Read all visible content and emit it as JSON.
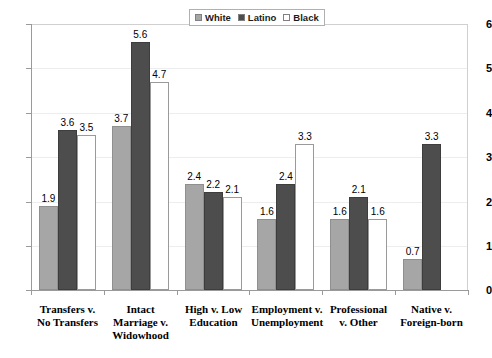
{
  "chart_data": {
    "type": "bar",
    "title": "",
    "subtitle": "",
    "xlabel": "",
    "ylabel": "",
    "ylim": [
      0,
      6
    ],
    "yticks": [
      "0",
      "1",
      "2",
      "3",
      "4",
      "5",
      "6"
    ],
    "grid": true,
    "legend_position": "top-center",
    "categories": [
      "Transfers v.\nNo Transfers",
      "Intact\nMarriage v.\nWidowhood",
      "High v. Low\nEducation",
      "Employment v.\nUnemployment",
      "Professional\nv. Other",
      "Native v.\nForeign-born"
    ],
    "series": [
      {
        "name": "White",
        "color": "#a6a6a6",
        "values": [
          1.9,
          3.7,
          2.4,
          1.6,
          1.6,
          0.7
        ],
        "labels": [
          "1.9",
          "3.7",
          "2.4",
          "1.6",
          "1.6",
          "0.7"
        ]
      },
      {
        "name": "Latino",
        "color": "#4d4d4d",
        "values": [
          3.6,
          5.6,
          2.2,
          2.4,
          2.1,
          3.3
        ],
        "labels": [
          "3.6",
          "5.6",
          "2.2",
          "2.4",
          "2.1",
          "3.3"
        ]
      },
      {
        "name": "Black",
        "color": "#ffffff",
        "values": [
          3.5,
          4.7,
          2.1,
          3.3,
          1.6,
          null
        ],
        "labels": [
          "3.5",
          "4.7",
          "2.1",
          "3.3",
          "1.6",
          ""
        ]
      }
    ]
  },
  "legend": {
    "items": [
      {
        "label": "White",
        "swatch": "#a6a6a6"
      },
      {
        "label": "Latino",
        "swatch": "#4d4d4d"
      },
      {
        "label": "Black",
        "swatch": "#ffffff"
      }
    ]
  },
  "yaxis": {
    "t0": "0",
    "t1": "1",
    "t2": "2",
    "t3": "3",
    "t4": "4",
    "t5": "5",
    "t6": "6"
  },
  "categories": {
    "c0": "Transfers v.\nNo Transfers",
    "c1": "Intact\nMarriage v.\nWidowhood",
    "c2": "High v. Low\nEducation",
    "c3": "Employment v.\nUnemployment",
    "c4": "Professional\nv. Other",
    "c5": "Native v.\nForeign-born"
  }
}
